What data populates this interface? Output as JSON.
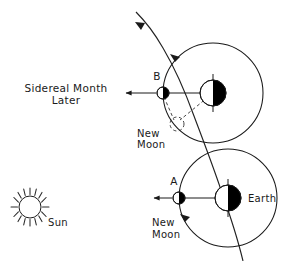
{
  "diagram": {
    "type": "astronomy-schematic",
    "background_color": "#ffffff",
    "line_color": "#1a1a1a"
  },
  "labels": {
    "sidereal_line1": "Sidereal Month",
    "sidereal_line2": "Later",
    "new_moon_upper_line1": "New",
    "new_moon_upper_line2": "Moon",
    "new_moon_lower_line1": "New",
    "new_moon_lower_line2": "Moon",
    "point_b": "B",
    "point_a": "A",
    "earth": "Earth",
    "sun": "Sun"
  },
  "bodies": {
    "sun": {
      "name": "sun",
      "cx": 30,
      "cy": 207,
      "radius": 11,
      "ray_count": 16,
      "ray_inner": 12.5,
      "ray_outer": 19,
      "label_x": 48,
      "label_y": 225
    },
    "earth_upper": {
      "name": "earth-upper",
      "cx": 213,
      "cy": 93,
      "radius": 13,
      "lit_side": "left",
      "dark_side": "right"
    },
    "earth_lower": {
      "name": "earth-lower",
      "cx": 228,
      "cy": 198,
      "radius": 13,
      "lit_side": "left",
      "dark_side": "right",
      "label_x": 248,
      "label_y": 202
    },
    "moon_b": {
      "name": "moon-b",
      "cx": 163,
      "cy": 93,
      "radius": 6,
      "lit_side": "left",
      "dark_side": "right",
      "label_x": 157,
      "label_y": 80
    },
    "moon_a": {
      "name": "moon-a",
      "cx": 179,
      "cy": 198,
      "radius": 6,
      "lit_side": "left",
      "dark_side": "right",
      "label_x": 174,
      "label_y": 185
    },
    "moon_new_dashed": {
      "name": "moon-new-position-dashed",
      "cx": 177,
      "cy": 124,
      "radius": 7
    }
  },
  "orbits": {
    "upper": {
      "cx": 213,
      "cy": 93,
      "radius": 50
    },
    "lower": {
      "cx": 228,
      "cy": 198,
      "radius": 49
    }
  },
  "annotations": {
    "sun_arrow_upper": {
      "from_x": 157,
      "to_x": 124,
      "y": 93
    },
    "sun_arrow_lower": {
      "from_x": 173,
      "to_x": 152,
      "y": 198
    },
    "orbit_direction_upper": "counterclockwise",
    "orbit_direction_lower": "counterclockwise",
    "trajectory_direction": "up-left"
  },
  "text_positions": {
    "sidereal_x": 66,
    "sidereal_y1": 92,
    "sidereal_y2": 104,
    "new_moon_upper_x": 137,
    "new_moon_upper_y1": 137,
    "new_moon_upper_y2": 148,
    "new_moon_lower_x": 152,
    "new_moon_lower_y1": 226,
    "new_moon_lower_y2": 238
  }
}
